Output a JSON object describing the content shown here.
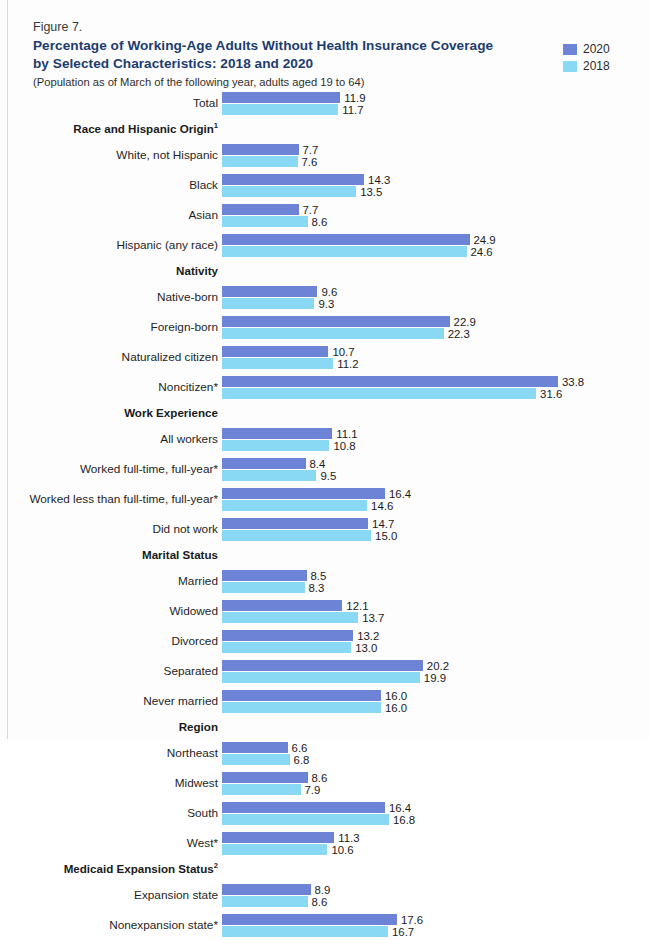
{
  "header": {
    "figure_number": "Figure 7.",
    "title_line1": "Percentage of Working-Age Adults Without Health Insurance Coverage",
    "title_line2": "by Selected Characteristics: 2018 and 2020",
    "subtitle": "(Population as of March of the following year, adults aged 19 to 64)"
  },
  "legend": {
    "items": [
      {
        "label": "2020",
        "color": "#6d83d6"
      },
      {
        "label": "2018",
        "color": "#8ad9f4"
      }
    ]
  },
  "colors": {
    "series_2020": "#6d83d6",
    "series_2018": "#8ad9f4",
    "title": "#1c3c6e",
    "text": "#1f1f1f",
    "background": "#fdfdfd"
  },
  "chart_data": {
    "type": "bar",
    "orientation": "horizontal",
    "title": "Percentage of Working-Age Adults Without Health Insurance Coverage by Selected Characteristics: 2018 and 2020",
    "subtitle": "(Population as of March of the following year, adults aged 19 to 64)",
    "xlabel": "",
    "ylabel": "",
    "xlim": [
      0,
      34
    ],
    "grid": false,
    "legend_position": "top-right",
    "value_labels": true,
    "series": [
      {
        "name": "2020",
        "color": "#6d83d6"
      },
      {
        "name": "2018",
        "color": "#8ad9f4"
      }
    ],
    "groups": [
      {
        "header": "",
        "header_footnote": "",
        "rows": [
          {
            "label": "Total",
            "v2020": 11.9,
            "v2018": 11.7
          }
        ]
      },
      {
        "header": "Race and Hispanic Origin",
        "header_footnote": "1",
        "rows": [
          {
            "label": "White, not Hispanic",
            "v2020": 7.7,
            "v2018": 7.6
          },
          {
            "label": "Black",
            "v2020": 14.3,
            "v2018": 13.5
          },
          {
            "label": "Asian",
            "v2020": 7.7,
            "v2018": 8.6
          },
          {
            "label": "Hispanic (any race)",
            "v2020": 24.9,
            "v2018": 24.6
          }
        ]
      },
      {
        "header": "Nativity",
        "header_footnote": "",
        "rows": [
          {
            "label": "Native-born",
            "v2020": 9.6,
            "v2018": 9.3
          },
          {
            "label": "Foreign-born",
            "v2020": 22.9,
            "v2018": 22.3
          },
          {
            "label": "Naturalized citizen",
            "v2020": 10.7,
            "v2018": 11.2
          },
          {
            "label": "Noncitizen*",
            "v2020": 33.8,
            "v2018": 31.6
          }
        ]
      },
      {
        "header": "Work Experience",
        "header_footnote": "",
        "rows": [
          {
            "label": "All workers",
            "v2020": 11.1,
            "v2018": 10.8
          },
          {
            "label": "Worked full-time, full-year*",
            "v2020": 8.4,
            "v2018": 9.5
          },
          {
            "label": "Worked less than full-time, full-year*",
            "v2020": 16.4,
            "v2018": 14.6
          },
          {
            "label": "Did not work",
            "v2020": 14.7,
            "v2018": 15.0
          }
        ]
      },
      {
        "header": "Marital Status",
        "header_footnote": "",
        "rows": [
          {
            "label": "Married",
            "v2020": 8.5,
            "v2018": 8.3
          },
          {
            "label": "Widowed",
            "v2020": 12.1,
            "v2018": 13.7
          },
          {
            "label": "Divorced",
            "v2020": 13.2,
            "v2018": 13.0
          },
          {
            "label": "Separated",
            "v2020": 20.2,
            "v2018": 19.9
          },
          {
            "label": "Never married",
            "v2020": 16.0,
            "v2018": 16.0
          }
        ]
      },
      {
        "header": "Region",
        "header_footnote": "",
        "rows": [
          {
            "label": "Northeast",
            "v2020": 6.6,
            "v2018": 6.8
          },
          {
            "label": "Midwest",
            "v2020": 8.6,
            "v2018": 7.9
          },
          {
            "label": "South",
            "v2020": 16.4,
            "v2018": 16.8
          },
          {
            "label": "West*",
            "v2020": 11.3,
            "v2018": 10.6
          }
        ]
      },
      {
        "header": "Medicaid Expansion Status",
        "header_footnote": "2",
        "rows": [
          {
            "label": "Expansion state",
            "v2020": 8.9,
            "v2018": 8.6
          },
          {
            "label": "Nonexpansion state*",
            "v2020": 17.6,
            "v2018": 16.7
          }
        ]
      }
    ]
  }
}
